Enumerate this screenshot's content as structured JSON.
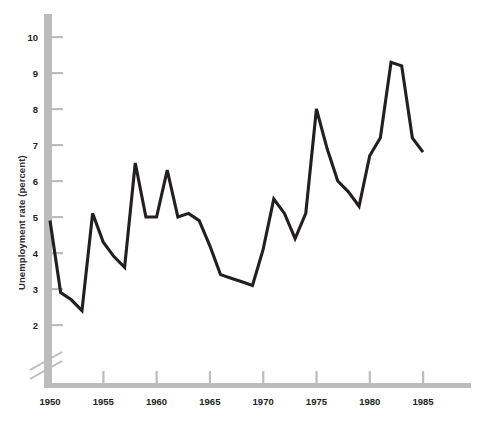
{
  "chart_data": {
    "type": "line",
    "title": "",
    "xlabel": "",
    "ylabel": "Unemployment rate (percent)",
    "xlim": [
      1949.2,
      1989.5
    ],
    "ylim": [
      1.75,
      10.55
    ],
    "axis_break": true,
    "axis_break_note": "y-axis broken below 2",
    "grid": false,
    "legend": "none",
    "line_color": "#231f20",
    "axis_color": "#bcbcbc",
    "xticks": [
      1950,
      1955,
      1960,
      1965,
      1970,
      1975,
      1980,
      1985
    ],
    "xtick_labels": [
      "1950",
      "1955",
      "1960",
      "1965",
      "1970",
      "1975",
      "1980",
      "1985"
    ],
    "yticks": [
      2,
      3,
      4,
      5,
      6,
      7,
      8,
      9,
      10
    ],
    "ytick_labels": [
      "2",
      "3",
      "4",
      "5",
      "6",
      "7",
      "8",
      "9",
      "10"
    ],
    "x": [
      1950,
      1951,
      1952,
      1953,
      1954,
      1955,
      1956,
      1957,
      1958,
      1959,
      1960,
      1961,
      1962,
      1963,
      1964,
      1965,
      1966,
      1967,
      1968,
      1969,
      1970,
      1971,
      1972,
      1973,
      1974,
      1975,
      1976,
      1977,
      1978,
      1979,
      1980,
      1981,
      1982,
      1983,
      1984,
      1985
    ],
    "values": [
      4.9,
      2.9,
      2.7,
      2.4,
      5.1,
      4.3,
      3.9,
      3.6,
      6.5,
      5.0,
      5.0,
      6.3,
      5.0,
      5.1,
      4.9,
      4.2,
      3.4,
      3.3,
      3.2,
      3.1,
      4.1,
      5.5,
      5.1,
      4.4,
      5.1,
      8.0,
      6.9,
      6.0,
      5.7,
      5.3,
      6.7,
      7.2,
      9.3,
      9.2,
      7.2,
      6.8
    ]
  }
}
